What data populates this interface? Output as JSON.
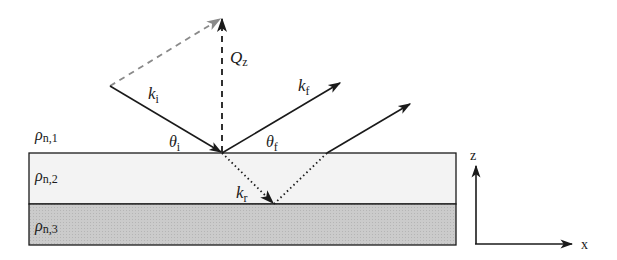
{
  "diagram": {
    "type": "neutron reflectometry scattering geometry",
    "colors": {
      "line": "#1a1a1a",
      "dashed_gray": "#8a8a8a",
      "layer2_fill": "#f3f3f3",
      "layer3_fill": "#c8c8c8"
    },
    "layers": [
      {
        "name": "rho_n1",
        "symbol": "ρ",
        "sub": "n,1"
      },
      {
        "name": "rho_n2",
        "symbol": "ρ",
        "sub": "n,2"
      },
      {
        "name": "rho_n3",
        "symbol": "ρ",
        "sub": "n,3"
      }
    ],
    "vectors": {
      "ki": {
        "symbol": "k",
        "sub": "i"
      },
      "kf": {
        "symbol": "k",
        "sub": "f"
      },
      "kr": {
        "symbol": "k",
        "sub": "r"
      },
      "qz": {
        "symbol": "Q",
        "sub": "z"
      }
    },
    "angles": {
      "theta_i": {
        "symbol": "θ",
        "sub": "i"
      },
      "theta_f": {
        "symbol": "θ",
        "sub": "f"
      }
    },
    "axes": {
      "z_label": "z",
      "x_label": "x"
    }
  }
}
